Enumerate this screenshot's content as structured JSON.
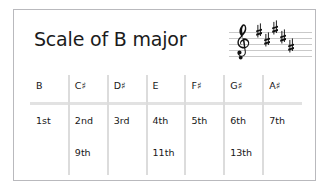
{
  "card": {
    "title": "Scale of B major",
    "border_color": "#b9b9bd",
    "background": "#ffffff"
  },
  "staff": {
    "name": "treble-staff-b-major",
    "clef": "treble-clef",
    "line_count": 5,
    "key_signature": "B major",
    "sharp_count": 5,
    "sharps": [
      "F#",
      "C#",
      "G#",
      "D#",
      "A#"
    ],
    "line_color": "#c9c9c9",
    "ink_color": "#111111"
  },
  "table": {
    "separator_color": "#dcdcdc",
    "rule_color": "#e2e2e2",
    "columns": [
      {
        "note": "B",
        "degree": "1st",
        "extension": ""
      },
      {
        "note": "C♯",
        "degree": "2nd",
        "extension": "9th"
      },
      {
        "note": "D♯",
        "degree": "3rd",
        "extension": ""
      },
      {
        "note": "E",
        "degree": "4th",
        "extension": "11th"
      },
      {
        "note": "F♯",
        "degree": "5th",
        "extension": ""
      },
      {
        "note": "G♯",
        "degree": "6th",
        "extension": "13th"
      },
      {
        "note": "A♯",
        "degree": "7th",
        "extension": ""
      }
    ]
  }
}
